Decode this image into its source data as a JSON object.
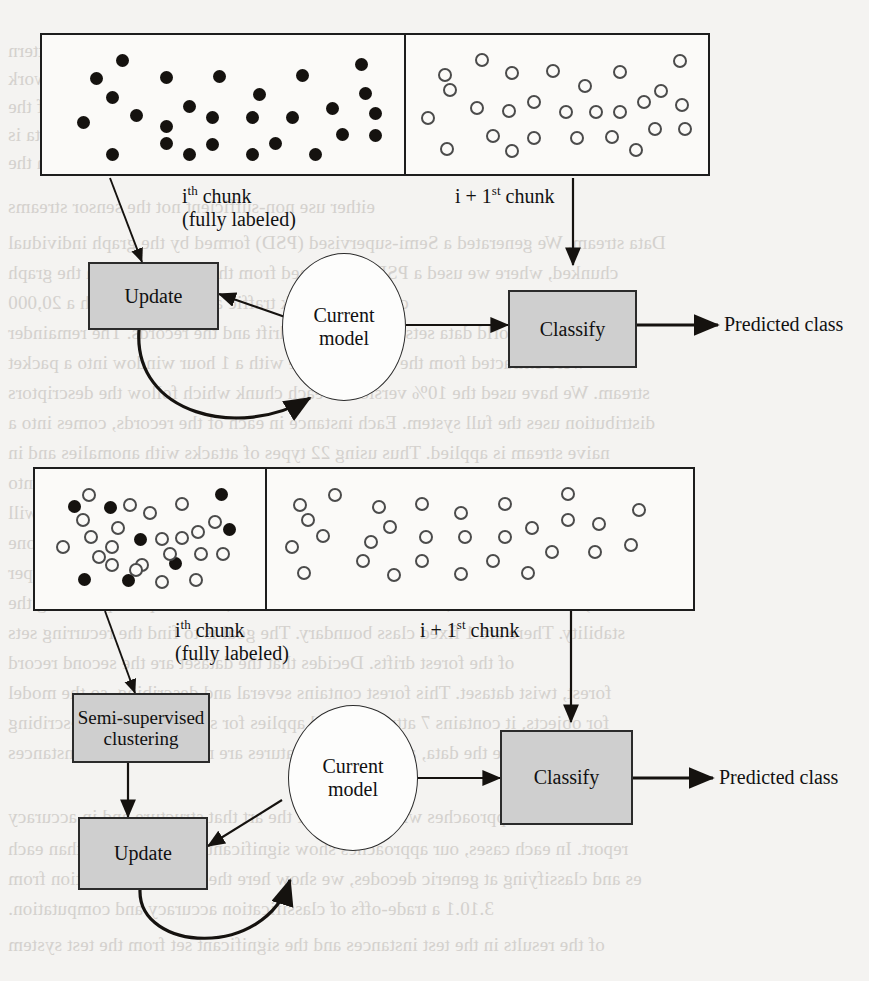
{
  "page": {
    "background_color": "#f4f3f1",
    "ink_color": "#15120f",
    "node_fill": "#cfcfcf",
    "bleed_text_color": "#cfccc8"
  },
  "bleed_lines": [
    {
      "text": "ures of the data were expected into a different order or the data and pattern",
      "x": 8,
      "y": 40,
      "mirrored": true
    },
    {
      "text": "the concept drift is modeled incrementally from the stream. Similar to this work",
      "x": 8,
      "y": 68,
      "mirrored": true
    },
    {
      "text": "the drift solution is unknown as is or Classification and for each of the",
      "x": 8,
      "y": 96,
      "mirrored": true
    },
    {
      "text": "we de-anchor and the classes of streams in different kinds of drifting. Data is",
      "x": 8,
      "y": 124,
      "mirrored": true
    },
    {
      "text": "there are discussed in the assignment extraction in an the",
      "x": 8,
      "y": 152,
      "mirrored": true
    },
    {
      "text": "either use non-sufficient not the sensor streams",
      "x": 8,
      "y": 196,
      "mirrored": true
    },
    {
      "text": "Data stream. We generated a Semi-supervised (PSD) formed by the graph individual",
      "x": 8,
      "y": 232,
      "mirrored": true
    },
    {
      "text": "chunked, where we used a PSD but learned from the LS model from the graph",
      "x": 8,
      "y": 262,
      "mirrored": true
    },
    {
      "text": "classify network traffic and classifier with a 20,000",
      "x": 8,
      "y": 292,
      "mirrored": true
    },
    {
      "text": "and 12 real-world data sets with different drift and the records. The remainder",
      "x": 8,
      "y": 322,
      "mirrored": true
    },
    {
      "text": "were extracted from the network trace with a 1 hour window into a packet",
      "x": 8,
      "y": 352,
      "mirrored": true
    },
    {
      "text": "stream. We have used the 10% version of each chunk which follow the descriptors",
      "x": 8,
      "y": 382,
      "mirrored": true
    },
    {
      "text": "distribution uses the full system. Each instance in each of the records, comes into a",
      "x": 8,
      "y": 412,
      "mirrored": true
    },
    {
      "text": "naive stream is applied. Thus using 22 types of attacks with anomalies and in",
      "x": 8,
      "y": 442,
      "mirrored": true
    },
    {
      "text": "every class present in a chunk. However, we separate the stream of records into",
      "x": 8,
      "y": 472,
      "mirrored": true
    },
    {
      "text": "sub-drift. Suppose that instead of the data going to a cluster, because a stream will",
      "x": 8,
      "y": 502,
      "mirrored": true
    },
    {
      "text": "the classes. Thus, there is also a set of these instances assigned to the nearest one",
      "x": 8,
      "y": 532,
      "mirrored": true
    },
    {
      "text": "of ASD. Learning is the best solution. When we apply the test of anti-super",
      "x": 8,
      "y": 562,
      "mirrored": true
    },
    {
      "text": "2010a). The data stream, since the model is a cluster, the set up for providing the",
      "x": 8,
      "y": 592,
      "mirrored": true
    },
    {
      "text": "stability. There are 1 fixed class boundary. The goal is to find the recurring sets",
      "x": 8,
      "y": 622,
      "mirrored": true
    },
    {
      "text": "of the forest drifts. Decides that the dataset are the second record",
      "x": 8,
      "y": 652,
      "mirrored": true
    },
    {
      "text": "forest, twist dataset. This forest contains several and describing, so the model",
      "x": 8,
      "y": 682,
      "mirrored": true
    },
    {
      "text": "for objects, it contains 7 attributes and applies for some forest and describing",
      "x": 8,
      "y": 712,
      "mirrored": true
    },
    {
      "text": "may normalize the data, and since the features are not changing the instances",
      "x": 8,
      "y": 742,
      "mirrored": true
    },
    {
      "text": "which our approaches with the state of the art that structure and in accuracy",
      "x": 8,
      "y": 806,
      "mirrored": true
    },
    {
      "text": "report. In each cases, our approaches show significantly better results than each",
      "x": 8,
      "y": 838,
      "mirrored": true
    },
    {
      "text": "es and classifying at generic decodes, we show here the per-class prediction from",
      "x": 8,
      "y": 868,
      "mirrored": true
    },
    {
      "text": "3.10.1 a trade-offs of classification accuracy and computation.",
      "x": 8,
      "y": 898,
      "mirrored": true
    },
    {
      "text": "of the results in the test instances and the significant set from the test system",
      "x": 8,
      "y": 934,
      "mirrored": true
    }
  ],
  "figures": [
    {
      "id": "fig-top",
      "name": "incremental-supervised-flow",
      "chunks": {
        "left_label_line1": "i",
        "left_label_sup1": "th",
        "left_label_rest1": " chunk",
        "left_label_line2": "(fully labeled)",
        "right_label_pre": "i + 1",
        "right_label_sup": "st",
        "right_label_post": " chunk"
      },
      "nodes": {
        "update": "Update",
        "current_model_line1": "Current",
        "current_model_line2": "model",
        "classify": "Classify",
        "output": "Predicted class"
      }
    },
    {
      "id": "fig-bottom",
      "name": "semi-supervised-flow",
      "chunks": {
        "left_label_line1": "i",
        "left_label_sup1": "th",
        "left_label_rest1": " chunk",
        "left_label_line2": "(fully labeled)",
        "right_label_pre": "i + 1",
        "right_label_sup": "st",
        "right_label_post": " chunk"
      },
      "nodes": {
        "clustering_line1": "Semi-supervised",
        "clustering_line2": "clustering",
        "update": "Update",
        "current_model_line1": "Current",
        "current_model_line2": "model",
        "classify": "Classify",
        "output": "Predicted class"
      }
    }
  ],
  "chart_data": {
    "type": "scatter",
    "title": "",
    "legend": [
      {
        "marker": "filled-circle",
        "meaning": "labeled instance"
      },
      {
        "marker": "hollow-circle",
        "meaning": "unlabeled instance"
      }
    ],
    "panels": [
      {
        "figure": "fig-top",
        "panel": "i-th chunk (fully labeled)",
        "marker_counts": {
          "filled": 27,
          "hollow": 0
        },
        "points": [
          {
            "x": 0.2,
            "y": 0.11,
            "type": "filled"
          },
          {
            "x": 0.12,
            "y": 0.27,
            "type": "filled"
          },
          {
            "x": 0.33,
            "y": 0.26,
            "type": "filled"
          },
          {
            "x": 0.49,
            "y": 0.25,
            "type": "filled"
          },
          {
            "x": 0.74,
            "y": 0.24,
            "type": "filled"
          },
          {
            "x": 0.92,
            "y": 0.14,
            "type": "filled"
          },
          {
            "x": 0.17,
            "y": 0.44,
            "type": "filled"
          },
          {
            "x": 0.61,
            "y": 0.41,
            "type": "filled"
          },
          {
            "x": 0.93,
            "y": 0.4,
            "type": "filled"
          },
          {
            "x": 0.4,
            "y": 0.52,
            "type": "filled"
          },
          {
            "x": 0.83,
            "y": 0.54,
            "type": "filled"
          },
          {
            "x": 0.96,
            "y": 0.58,
            "type": "filled"
          },
          {
            "x": 0.24,
            "y": 0.6,
            "type": "filled"
          },
          {
            "x": 0.47,
            "y": 0.62,
            "type": "filled"
          },
          {
            "x": 0.59,
            "y": 0.62,
            "type": "filled"
          },
          {
            "x": 0.71,
            "y": 0.62,
            "type": "filled"
          },
          {
            "x": 0.08,
            "y": 0.66,
            "type": "filled"
          },
          {
            "x": 0.33,
            "y": 0.7,
            "type": "filled"
          },
          {
            "x": 0.86,
            "y": 0.77,
            "type": "filled"
          },
          {
            "x": 0.96,
            "y": 0.78,
            "type": "filled"
          },
          {
            "x": 0.33,
            "y": 0.85,
            "type": "filled"
          },
          {
            "x": 0.47,
            "y": 0.86,
            "type": "filled"
          },
          {
            "x": 0.66,
            "y": 0.85,
            "type": "filled"
          },
          {
            "x": 0.17,
            "y": 0.95,
            "type": "filled"
          },
          {
            "x": 0.4,
            "y": 0.95,
            "type": "filled"
          },
          {
            "x": 0.59,
            "y": 0.95,
            "type": "filled"
          },
          {
            "x": 0.78,
            "y": 0.95,
            "type": "filled"
          }
        ]
      },
      {
        "figure": "fig-top",
        "panel": "i + 1-st chunk",
        "marker_counts": {
          "filled": 0,
          "hollow": 27
        },
        "points": [
          {
            "x": 0.22,
            "y": 0.1,
            "type": "hollow"
          },
          {
            "x": 0.95,
            "y": 0.11,
            "type": "hollow"
          },
          {
            "x": 0.08,
            "y": 0.23,
            "type": "hollow"
          },
          {
            "x": 0.33,
            "y": 0.22,
            "type": "hollow"
          },
          {
            "x": 0.48,
            "y": 0.2,
            "type": "hollow"
          },
          {
            "x": 0.73,
            "y": 0.21,
            "type": "hollow"
          },
          {
            "x": 0.1,
            "y": 0.37,
            "type": "hollow"
          },
          {
            "x": 0.6,
            "y": 0.33,
            "type": "hollow"
          },
          {
            "x": 0.88,
            "y": 0.38,
            "type": "hollow"
          },
          {
            "x": 0.41,
            "y": 0.48,
            "type": "hollow"
          },
          {
            "x": 0.82,
            "y": 0.48,
            "type": "hollow"
          },
          {
            "x": 0.96,
            "y": 0.5,
            "type": "hollow"
          },
          {
            "x": 0.2,
            "y": 0.53,
            "type": "hollow"
          },
          {
            "x": 0.32,
            "y": 0.56,
            "type": "hollow"
          },
          {
            "x": 0.53,
            "y": 0.57,
            "type": "hollow"
          },
          {
            "x": 0.64,
            "y": 0.57,
            "type": "hollow"
          },
          {
            "x": 0.73,
            "y": 0.57,
            "type": "hollow"
          },
          {
            "x": 0.02,
            "y": 0.62,
            "type": "hollow"
          },
          {
            "x": 0.86,
            "y": 0.72,
            "type": "hollow"
          },
          {
            "x": 0.97,
            "y": 0.72,
            "type": "hollow"
          },
          {
            "x": 0.26,
            "y": 0.78,
            "type": "hollow"
          },
          {
            "x": 0.41,
            "y": 0.8,
            "type": "hollow"
          },
          {
            "x": 0.57,
            "y": 0.8,
            "type": "hollow"
          },
          {
            "x": 0.7,
            "y": 0.79,
            "type": "hollow"
          },
          {
            "x": 0.09,
            "y": 0.9,
            "type": "hollow"
          },
          {
            "x": 0.33,
            "y": 0.92,
            "type": "hollow"
          },
          {
            "x": 0.79,
            "y": 0.91,
            "type": "hollow"
          }
        ]
      },
      {
        "figure": "fig-bottom",
        "panel": "i-th chunk (fully labeled)",
        "marker_counts": {
          "filled": 8,
          "hollow": 22
        },
        "points": [
          {
            "x": 0.19,
            "y": 0.11,
            "type": "hollow"
          },
          {
            "x": 0.12,
            "y": 0.21,
            "type": "filled"
          },
          {
            "x": 0.3,
            "y": 0.22,
            "type": "filled"
          },
          {
            "x": 0.4,
            "y": 0.2,
            "type": "hollow"
          },
          {
            "x": 0.5,
            "y": 0.27,
            "type": "hollow"
          },
          {
            "x": 0.66,
            "y": 0.19,
            "type": "hollow"
          },
          {
            "x": 0.86,
            "y": 0.11,
            "type": "filled"
          },
          {
            "x": 0.16,
            "y": 0.33,
            "type": "hollow"
          },
          {
            "x": 0.34,
            "y": 0.4,
            "type": "hollow"
          },
          {
            "x": 0.83,
            "y": 0.35,
            "type": "hollow"
          },
          {
            "x": 0.9,
            "y": 0.42,
            "type": "filled"
          },
          {
            "x": 0.2,
            "y": 0.48,
            "type": "hollow"
          },
          {
            "x": 0.45,
            "y": 0.5,
            "type": "filled"
          },
          {
            "x": 0.56,
            "y": 0.5,
            "type": "hollow"
          },
          {
            "x": 0.66,
            "y": 0.49,
            "type": "hollow"
          },
          {
            "x": 0.74,
            "y": 0.44,
            "type": "hollow"
          },
          {
            "x": 0.06,
            "y": 0.57,
            "type": "hollow"
          },
          {
            "x": 0.31,
            "y": 0.57,
            "type": "hollow"
          },
          {
            "x": 0.76,
            "y": 0.63,
            "type": "hollow"
          },
          {
            "x": 0.87,
            "y": 0.63,
            "type": "hollow"
          },
          {
            "x": 0.31,
            "y": 0.73,
            "type": "hollow"
          },
          {
            "x": 0.46,
            "y": 0.73,
            "type": "hollow"
          },
          {
            "x": 0.63,
            "y": 0.72,
            "type": "filled"
          },
          {
            "x": 0.17,
            "y": 0.86,
            "type": "filled"
          },
          {
            "x": 0.39,
            "y": 0.87,
            "type": "filled"
          },
          {
            "x": 0.43,
            "y": 0.78,
            "type": "hollow"
          },
          {
            "x": 0.56,
            "y": 0.88,
            "type": "hollow"
          },
          {
            "x": 0.73,
            "y": 0.87,
            "type": "hollow"
          },
          {
            "x": 0.24,
            "y": 0.66,
            "type": "hollow"
          },
          {
            "x": 0.6,
            "y": 0.63,
            "type": "hollow"
          }
        ]
      },
      {
        "figure": "fig-bottom",
        "panel": "i + 1-st chunk",
        "marker_counts": {
          "filled": 0,
          "hollow": 29
        },
        "points": [
          {
            "x": 0.13,
            "y": 0.11,
            "type": "hollow"
          },
          {
            "x": 0.72,
            "y": 0.1,
            "type": "hollow"
          },
          {
            "x": 0.04,
            "y": 0.2,
            "type": "hollow"
          },
          {
            "x": 0.24,
            "y": 0.21,
            "type": "hollow"
          },
          {
            "x": 0.35,
            "y": 0.19,
            "type": "hollow"
          },
          {
            "x": 0.56,
            "y": 0.19,
            "type": "hollow"
          },
          {
            "x": 0.45,
            "y": 0.27,
            "type": "hollow"
          },
          {
            "x": 0.06,
            "y": 0.33,
            "type": "hollow"
          },
          {
            "x": 0.72,
            "y": 0.33,
            "type": "hollow"
          },
          {
            "x": 0.8,
            "y": 0.37,
            "type": "hollow"
          },
          {
            "x": 0.27,
            "y": 0.39,
            "type": "hollow"
          },
          {
            "x": 0.63,
            "y": 0.4,
            "type": "hollow"
          },
          {
            "x": 0.1,
            "y": 0.47,
            "type": "hollow"
          },
          {
            "x": 0.36,
            "y": 0.48,
            "type": "hollow"
          },
          {
            "x": 0.46,
            "y": 0.48,
            "type": "hollow"
          },
          {
            "x": 0.56,
            "y": 0.48,
            "type": "hollow"
          },
          {
            "x": 0.22,
            "y": 0.53,
            "type": "hollow"
          },
          {
            "x": 0.02,
            "y": 0.57,
            "type": "hollow"
          },
          {
            "x": 0.68,
            "y": 0.62,
            "type": "hollow"
          },
          {
            "x": 0.79,
            "y": 0.62,
            "type": "hollow"
          },
          {
            "x": 0.2,
            "y": 0.7,
            "type": "hollow"
          },
          {
            "x": 0.35,
            "y": 0.7,
            "type": "hollow"
          },
          {
            "x": 0.53,
            "y": 0.7,
            "type": "hollow"
          },
          {
            "x": 0.05,
            "y": 0.8,
            "type": "hollow"
          },
          {
            "x": 0.28,
            "y": 0.82,
            "type": "hollow"
          },
          {
            "x": 0.45,
            "y": 0.81,
            "type": "hollow"
          },
          {
            "x": 0.62,
            "y": 0.8,
            "type": "hollow"
          },
          {
            "x": 0.88,
            "y": 0.55,
            "type": "hollow"
          },
          {
            "x": 0.9,
            "y": 0.24,
            "type": "hollow"
          }
        ]
      }
    ]
  }
}
